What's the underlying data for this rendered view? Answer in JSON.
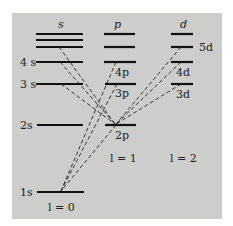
{
  "diagram": {
    "type": "energy-level diagram",
    "columns": [
      {
        "header": "s",
        "l_label": "l = 0"
      },
      {
        "header": "p",
        "l_label": "l = 1"
      },
      {
        "header": "d",
        "l_label": "l = 2"
      }
    ],
    "levels": {
      "s": [
        "1s",
        "2s",
        "3s",
        "4s"
      ],
      "p": [
        "2p",
        "3p",
        "4p"
      ],
      "d": [
        "3d",
        "4d",
        "5d"
      ]
    },
    "transitions_note": "dashed lines from s and d levels to 2p; dashed lines from p levels to 1s"
  },
  "labels": {
    "col_s": "s",
    "col_p": "p",
    "col_d": "d",
    "s1": "1s",
    "s2": "2s",
    "s3": "3 s",
    "s4": "4 s",
    "p2": "2p",
    "p3": "3p",
    "p4": "4p",
    "d3": "3d",
    "d4": "4d",
    "d5": "5d",
    "l0": "l = 0",
    "l1": "l = 1",
    "l2": "l = 2"
  }
}
